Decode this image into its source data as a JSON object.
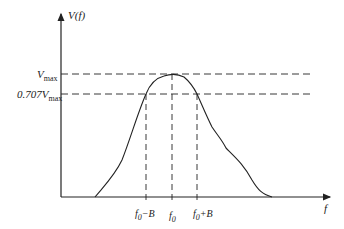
{
  "diagram": {
    "y_axis_label": "V(f)",
    "x_axis_label": "f",
    "levels": [
      {
        "name": "vmax",
        "main": "V",
        "sub": "max",
        "prefix": ""
      },
      {
        "name": "half-power",
        "main": "V",
        "sub": "max",
        "prefix": "0.707"
      }
    ],
    "frequency_markers": [
      {
        "name": "f0-minus-b",
        "main": "f",
        "sub": "0",
        "suffix": "−B"
      },
      {
        "name": "f0",
        "main": "f",
        "sub": "0",
        "suffix": ""
      },
      {
        "name": "f0-plus-b",
        "main": "f",
        "sub": "0",
        "suffix": "+B"
      }
    ],
    "colors": {
      "line": "#222222",
      "background": "#ffffff"
    }
  }
}
